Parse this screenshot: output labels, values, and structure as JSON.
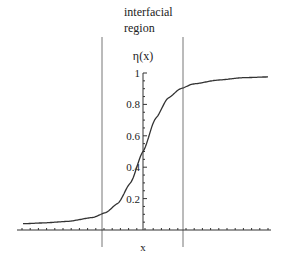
{
  "chart_data": {
    "type": "line",
    "title": "",
    "annotation": [
      "interfacial",
      "region"
    ],
    "xlabel": "x",
    "ylabel": "η(x)",
    "yticks": [
      "0.2",
      "0.4",
      "0.6",
      "0.8",
      "1"
    ],
    "ytick_values": [
      0.2,
      0.4,
      0.6,
      0.8,
      1.0
    ],
    "ylim": [
      0,
      1
    ],
    "xlim": [
      -1,
      1
    ],
    "grid": false,
    "legend": null,
    "vertical_lines": [
      {
        "name": "interface-left-boundary",
        "x": -0.33
      },
      {
        "name": "interface-right-boundary",
        "x": 0.32
      }
    ],
    "series": [
      {
        "name": "η(x)",
        "x": [
          -0.96,
          -0.8,
          -0.6,
          -0.4,
          -0.3,
          -0.2,
          -0.1,
          0.0,
          0.1,
          0.2,
          0.3,
          0.4,
          0.6,
          0.8,
          1.0
        ],
        "values": [
          0.04,
          0.045,
          0.055,
          0.08,
          0.11,
          0.17,
          0.3,
          0.5,
          0.71,
          0.84,
          0.9,
          0.93,
          0.955,
          0.97,
          0.975
        ]
      }
    ]
  }
}
